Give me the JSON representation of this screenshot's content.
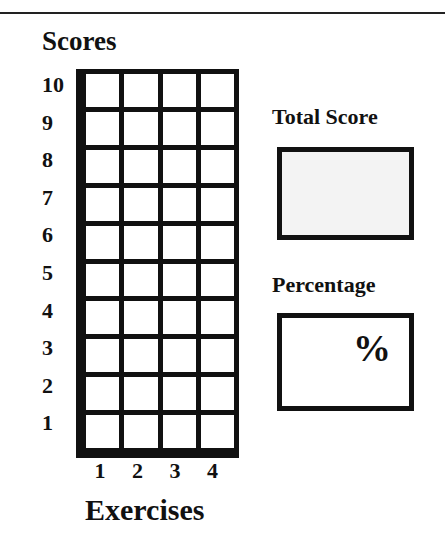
{
  "header": {
    "title": "Scores"
  },
  "grid": {
    "rows": 10,
    "columns": 4,
    "y_labels": [
      "10",
      "9",
      "8",
      "7",
      "6",
      "5",
      "4",
      "3",
      "2",
      "1"
    ],
    "x_labels": [
      "1",
      "2",
      "3",
      "4"
    ],
    "x_title": "Exercises"
  },
  "total_score": {
    "label": "Total Score",
    "value": ""
  },
  "percentage": {
    "label": "Percentage",
    "value": "",
    "unit": "%"
  }
}
